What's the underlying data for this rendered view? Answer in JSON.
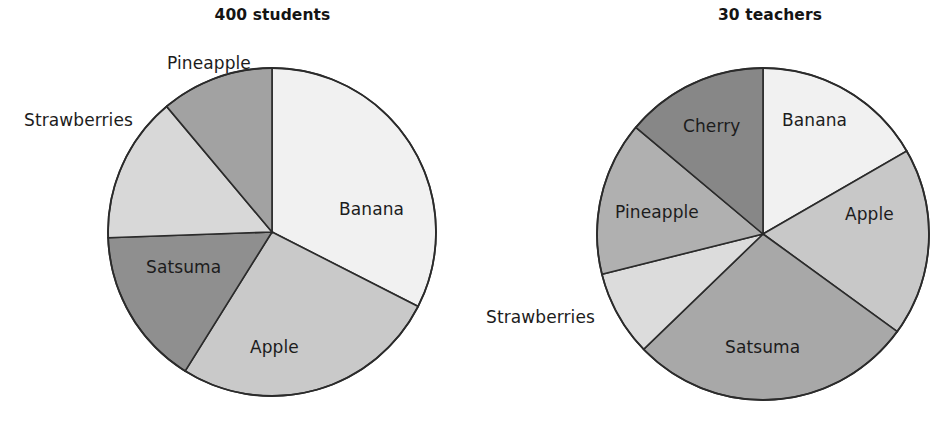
{
  "chart_data": [
    {
      "type": "pie",
      "title": "400 students",
      "total": 400,
      "unit": "students",
      "categories": [
        "Banana",
        "Apple",
        "Satsuma",
        "Strawberries",
        "Pineapple"
      ],
      "values": [
        130,
        106,
        62,
        58,
        44
      ],
      "angles_deg": [
        117,
        95,
        56,
        52,
        40
      ],
      "legend": "none",
      "labels_inside": [
        "Banana",
        "Apple",
        "Satsuma"
      ],
      "labels_outside": [
        "Strawberries",
        "Pineapple"
      ],
      "slice_colors": [
        "#f1f1f1",
        "#c9c9c9",
        "#8f8f8f",
        "#d8d8d8",
        "#a2a2a2"
      ],
      "stroke_color": "#2b2b2b"
    },
    {
      "type": "pie",
      "title": "30 teachers",
      "total": 30,
      "unit": "teachers",
      "categories": [
        "Banana",
        "Apple",
        "Satsuma",
        "Strawberries",
        "Pineapple",
        "Cherry"
      ],
      "values": [
        5,
        5.5,
        8.5,
        2.5,
        4.5,
        4
      ],
      "angles_deg": [
        60,
        66,
        100,
        30,
        54,
        50
      ],
      "legend": "none",
      "labels_inside": [
        "Banana",
        "Apple",
        "Satsuma",
        "Pineapple",
        "Cherry"
      ],
      "labels_outside": [
        "Strawberries"
      ],
      "slice_colors": [
        "#f1f1f1",
        "#c8c8c8",
        "#a8a8a8",
        "#dcdcdc",
        "#b0b0b0",
        "#878787"
      ],
      "stroke_color": "#2b2b2b"
    }
  ],
  "charts": {
    "students": {
      "title": "400 students",
      "labels": {
        "banana": "Banana",
        "apple": "Apple",
        "satsuma": "Satsuma",
        "strawberries": "Strawberries",
        "pineapple": "Pineapple"
      }
    },
    "teachers": {
      "title": "30 teachers",
      "labels": {
        "banana": "Banana",
        "apple": "Apple",
        "satsuma": "Satsuma",
        "strawberries": "Strawberries",
        "pineapple": "Pineapple",
        "cherry": "Cherry"
      }
    }
  }
}
